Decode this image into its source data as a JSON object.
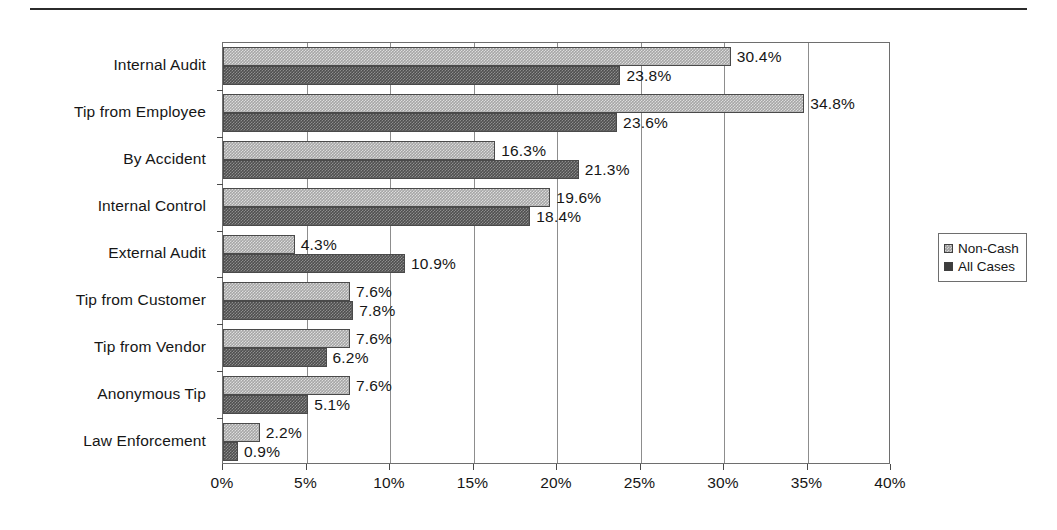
{
  "chart_data": {
    "type": "bar",
    "orientation": "horizontal",
    "title": "",
    "subtitle": "",
    "xlabel": "",
    "ylabel": "",
    "xlim": [
      0,
      40
    ],
    "xtick_values": [
      0,
      5,
      10,
      15,
      20,
      25,
      30,
      35,
      40
    ],
    "xtick_labels": [
      "0%",
      "5%",
      "10%",
      "15%",
      "20%",
      "25%",
      "30%",
      "35%",
      "40%"
    ],
    "grid": true,
    "grid_axis": "x",
    "legend_position": "right-outside",
    "categories": [
      "Internal Audit",
      "Tip from Employee",
      "By Accident",
      "Internal Control",
      "External Audit",
      "Tip from Customer",
      "Tip from Vendor",
      "Anonymous Tip",
      "Law Enforcement"
    ],
    "series": [
      {
        "name": "Non-Cash",
        "color": "#a6a6a6",
        "values": [
          30.4,
          34.8,
          16.3,
          19.6,
          4.3,
          7.6,
          7.6,
          7.6,
          2.2
        ],
        "labels": [
          "30.4%",
          "34.8%",
          "16.3%",
          "19.6%",
          "4.3%",
          "7.6%",
          "7.6%",
          "7.6%",
          "2.2%"
        ]
      },
      {
        "name": "All Cases",
        "color": "#4f4f4f",
        "values": [
          23.8,
          23.6,
          21.3,
          18.4,
          10.9,
          7.8,
          6.2,
          5.1,
          0.9
        ],
        "labels": [
          "23.8%",
          "23.6%",
          "21.3%",
          "18.4%",
          "10.9%",
          "7.8%",
          "6.2%",
          "5.1%",
          "0.9%"
        ]
      }
    ]
  },
  "legend": {
    "items": [
      {
        "label": "Non-Cash",
        "swatch": "light"
      },
      {
        "label": "All Cases",
        "swatch": "dark"
      }
    ]
  }
}
